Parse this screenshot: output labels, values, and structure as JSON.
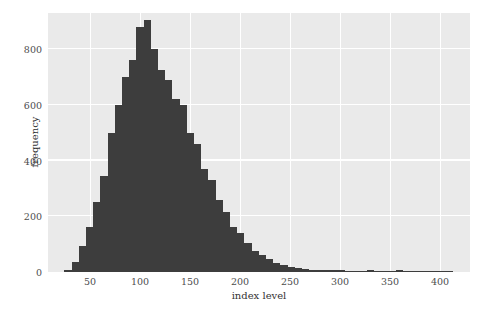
{
  "chart_data": {
    "type": "bar",
    "title": "",
    "subtitle": "",
    "xlabel": "index level",
    "ylabel": "frequency",
    "xlim": [
      8,
      430
    ],
    "ylim": [
      0,
      930
    ],
    "xticks": [
      50,
      100,
      150,
      200,
      250,
      300,
      350,
      400
    ],
    "yticks": [
      0,
      200,
      400,
      600,
      800
    ],
    "xtick_labels": [
      "50",
      "100",
      "150",
      "200",
      "250",
      "300",
      "350",
      "400"
    ],
    "ytick_labels": [
      "0",
      "200",
      "400",
      "600",
      "800"
    ],
    "grid": true,
    "legend": null,
    "bin_width": 7.2,
    "bar_color": "#3d3d3d",
    "plot_background": "#eaeaea",
    "gridline_color": "#ffffff",
    "figure_background": "#ffffff",
    "note": "Right-skewed histogram of index level; bin centers are bin_start + bin_width/2",
    "bins": [
      {
        "start": 24.4,
        "end": 31.6,
        "value": 8
      },
      {
        "start": 31.6,
        "end": 38.8,
        "value": 35
      },
      {
        "start": 38.8,
        "end": 46.0,
        "value": 95
      },
      {
        "start": 46.0,
        "end": 53.2,
        "value": 160
      },
      {
        "start": 53.2,
        "end": 60.4,
        "value": 250
      },
      {
        "start": 60.4,
        "end": 67.6,
        "value": 345
      },
      {
        "start": 67.6,
        "end": 74.8,
        "value": 500
      },
      {
        "start": 74.8,
        "end": 82.0,
        "value": 600
      },
      {
        "start": 82.0,
        "end": 89.2,
        "value": 700
      },
      {
        "start": 89.2,
        "end": 96.4,
        "value": 760
      },
      {
        "start": 96.4,
        "end": 103.6,
        "value": 880
      },
      {
        "start": 103.6,
        "end": 110.8,
        "value": 905
      },
      {
        "start": 110.8,
        "end": 118.0,
        "value": 800
      },
      {
        "start": 118.0,
        "end": 125.2,
        "value": 725
      },
      {
        "start": 125.2,
        "end": 132.4,
        "value": 690
      },
      {
        "start": 132.4,
        "end": 139.6,
        "value": 620
      },
      {
        "start": 139.6,
        "end": 146.8,
        "value": 600
      },
      {
        "start": 146.8,
        "end": 154.0,
        "value": 500
      },
      {
        "start": 154.0,
        "end": 161.2,
        "value": 460
      },
      {
        "start": 161.2,
        "end": 168.4,
        "value": 370
      },
      {
        "start": 168.4,
        "end": 175.6,
        "value": 330
      },
      {
        "start": 175.6,
        "end": 182.8,
        "value": 260
      },
      {
        "start": 182.8,
        "end": 190.0,
        "value": 215
      },
      {
        "start": 190.0,
        "end": 197.2,
        "value": 160
      },
      {
        "start": 197.2,
        "end": 204.4,
        "value": 140
      },
      {
        "start": 204.4,
        "end": 211.6,
        "value": 105
      },
      {
        "start": 211.6,
        "end": 218.8,
        "value": 75
      },
      {
        "start": 218.8,
        "end": 226.0,
        "value": 60
      },
      {
        "start": 226.0,
        "end": 233.2,
        "value": 45
      },
      {
        "start": 233.2,
        "end": 240.4,
        "value": 34
      },
      {
        "start": 240.4,
        "end": 247.6,
        "value": 26
      },
      {
        "start": 247.6,
        "end": 254.8,
        "value": 18
      },
      {
        "start": 254.8,
        "end": 262.0,
        "value": 14
      },
      {
        "start": 262.0,
        "end": 269.2,
        "value": 11
      },
      {
        "start": 269.2,
        "end": 276.4,
        "value": 9
      },
      {
        "start": 276.4,
        "end": 283.6,
        "value": 8
      },
      {
        "start": 283.6,
        "end": 290.8,
        "value": 7
      },
      {
        "start": 290.8,
        "end": 298.0,
        "value": 6
      },
      {
        "start": 298.0,
        "end": 305.2,
        "value": 6
      },
      {
        "start": 305.2,
        "end": 312.4,
        "value": 5
      },
      {
        "start": 312.4,
        "end": 319.6,
        "value": 4
      },
      {
        "start": 319.6,
        "end": 326.8,
        "value": 4
      },
      {
        "start": 326.8,
        "end": 334.0,
        "value": 8
      },
      {
        "start": 334.0,
        "end": 341.2,
        "value": 4
      },
      {
        "start": 341.2,
        "end": 348.4,
        "value": 3
      },
      {
        "start": 348.4,
        "end": 355.6,
        "value": 3
      },
      {
        "start": 355.6,
        "end": 362.8,
        "value": 7
      },
      {
        "start": 362.8,
        "end": 370.0,
        "value": 3
      },
      {
        "start": 370.0,
        "end": 377.2,
        "value": 2
      },
      {
        "start": 377.2,
        "end": 384.4,
        "value": 2
      },
      {
        "start": 384.4,
        "end": 391.6,
        "value": 2
      },
      {
        "start": 391.6,
        "end": 398.8,
        "value": 2
      },
      {
        "start": 398.8,
        "end": 406.0,
        "value": 3
      },
      {
        "start": 406.0,
        "end": 413.2,
        "value": 2
      },
      {
        "start": 413.2,
        "end": 420.4,
        "value": 1
      }
    ]
  }
}
